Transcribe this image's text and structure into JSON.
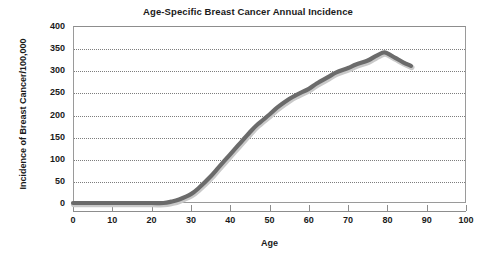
{
  "chart_data": {
    "type": "line",
    "title": "Age-Specific Breast Cancer Annual Incidence",
    "xlabel": "Age",
    "ylabel": "Incidence of Breast Cancer/100,000",
    "xlim": [
      0,
      100
    ],
    "ylim": [
      0,
      400
    ],
    "xticks": [
      0,
      10,
      20,
      30,
      40,
      50,
      60,
      70,
      80,
      90,
      100
    ],
    "yticks": [
      0,
      50,
      100,
      150,
      200,
      250,
      300,
      350,
      400
    ],
    "grid": "horizontal-dotted",
    "legend": null,
    "series": [
      {
        "name": "Breast cancer incidence",
        "color": "#6b6b6b",
        "x": [
          0,
          5,
          10,
          15,
          20,
          23,
          25,
          27,
          30,
          32,
          35,
          37,
          40,
          42,
          45,
          47,
          50,
          52,
          55,
          57,
          60,
          62,
          65,
          67,
          70,
          72,
          75,
          77,
          79,
          80,
          82,
          84,
          86
        ],
        "values": [
          0,
          0,
          0,
          0,
          0,
          0,
          3,
          8,
          20,
          34,
          60,
          80,
          110,
          130,
          160,
          178,
          200,
          216,
          235,
          245,
          258,
          270,
          285,
          295,
          305,
          313,
          322,
          332,
          340,
          338,
          328,
          318,
          310
        ]
      }
    ],
    "annotations": []
  },
  "axes": {
    "y_tick_labels": [
      "400",
      "350",
      "300",
      "250",
      "200",
      "150",
      "100",
      "50",
      "0"
    ],
    "x_tick_labels": [
      "0",
      "10",
      "20",
      "30",
      "40",
      "50",
      "60",
      "70",
      "80",
      "90",
      "100"
    ]
  }
}
